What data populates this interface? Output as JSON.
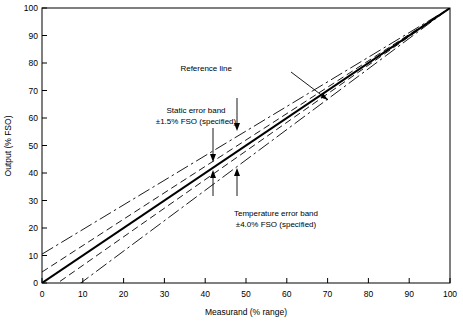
{
  "chart_data": {
    "type": "line",
    "title": "",
    "xlabel": "Measurand (% range)",
    "ylabel": "Output (% FSO)",
    "xlim": [
      0,
      100
    ],
    "ylim": [
      0,
      100
    ],
    "grid": false,
    "legend_position": "none",
    "xticks": [
      "0",
      "10",
      "20",
      "30",
      "40",
      "50",
      "60",
      "70",
      "80",
      "90",
      "100"
    ],
    "yticks": [
      "0",
      "10",
      "20",
      "30",
      "40",
      "50",
      "60",
      "70",
      "80",
      "90",
      "100"
    ],
    "x": [
      0,
      100
    ],
    "series": [
      {
        "name": "Reference line",
        "style": "solid",
        "values": [
          0,
          100
        ]
      },
      {
        "name": "Static error band upper (+1.5% FSO)",
        "style": "dashed",
        "values": [
          4.0,
          100
        ]
      },
      {
        "name": "Static error band lower (-1.5% FSO)",
        "style": "dashed",
        "values": [
          -4.0,
          100
        ]
      },
      {
        "name": "Temperature error band upper (+4.0% FSO)",
        "style": "dash-dot",
        "values": [
          10.5,
          100
        ]
      },
      {
        "name": "Temperature error band lower (-4.0% FSO)",
        "style": "dash-dot",
        "values": [
          -10.5,
          100
        ]
      }
    ],
    "annotations": [
      {
        "name": "reference-line",
        "text": "Reference line",
        "x": 55,
        "y": 76
      },
      {
        "name": "static-error-band",
        "line1": "Static error band",
        "line2": "±1.5% FSO (specified)",
        "x": 33,
        "y": 63
      },
      {
        "name": "temperature-error-band",
        "line1": "Temperature error band",
        "line2": "±4.0% FSO (specified)",
        "x": 52,
        "y": 26
      }
    ]
  },
  "labels": {
    "xaxis_title": "Measurand (% range)",
    "yaxis_title": "Output (% FSO)",
    "reference_line": "Reference line",
    "static_band_l1": "Static error band",
    "static_band_l2": "±1.5% FSO (specified)",
    "temp_band_l1": "Temperature error band",
    "temp_band_l2": "±4.0% FSO (specified)"
  },
  "colors": {
    "ink": "#000000",
    "background": "#ffffff"
  }
}
